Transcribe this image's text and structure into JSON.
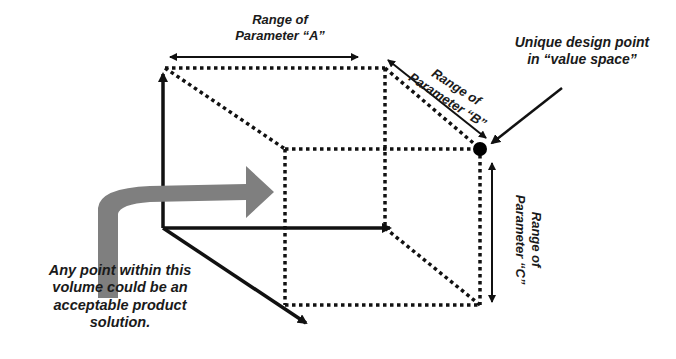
{
  "diagram": {
    "type": "3D design-space box",
    "labels": {
      "param_a": "Range of Parameter “A”",
      "param_a_line1": "Range of",
      "param_a_line2": "Parameter “A”",
      "param_b_line1": "Range of",
      "param_b_line2": "Parameter “B”",
      "param_c_line1": "Range of",
      "param_c_line2": "Parameter “C”",
      "unique_point_line1": "Unique design point",
      "unique_point_line2": "in “value space”",
      "volume_line1": "Any point within this",
      "volume_line2": "volume could be an",
      "volume_line3": "acceptable product",
      "volume_line4": "solution."
    },
    "colors": {
      "ink": "#111111",
      "arrow_fill": "#7f7f7f",
      "background": "#ffffff"
    }
  }
}
